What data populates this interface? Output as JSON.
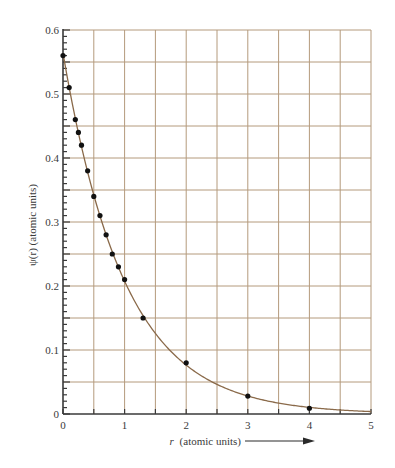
{
  "chart_data": {
    "type": "scatter",
    "title": "",
    "xlabel": "r (atomic units)",
    "xlabel_italic_part": "r",
    "xlabel_rest": "(atomic units)",
    "ylabel": "ψ(r) (atomic units)",
    "xlim": [
      0,
      5
    ],
    "ylim": [
      0,
      0.6
    ],
    "grid": true,
    "x_ticks": [
      0,
      1,
      2,
      3,
      4,
      5
    ],
    "x_tick_labels": [
      "0",
      "1",
      "2",
      "3",
      "4",
      "5"
    ],
    "y_ticks": [
      0,
      0.1,
      0.2,
      0.3,
      0.4,
      0.5,
      0.6
    ],
    "y_tick_labels": [
      "0",
      "0.1",
      "0.2",
      "0.3",
      "0.4",
      "0.5",
      "0.6"
    ],
    "x_grid_step": 0.5,
    "y_grid_step": 0.05,
    "y_minor_step": 0.01,
    "series": [
      {
        "name": "data points",
        "kind": "scatter",
        "color": "#111111",
        "x": [
          0,
          0.1,
          0.2,
          0.25,
          0.3,
          0.4,
          0.5,
          0.6,
          0.7,
          0.8,
          0.9,
          1.0,
          1.3,
          2.0,
          3.0,
          4.0
        ],
        "y": [
          0.56,
          0.51,
          0.46,
          0.44,
          0.42,
          0.38,
          0.34,
          0.31,
          0.28,
          0.25,
          0.23,
          0.21,
          0.15,
          0.08,
          0.028,
          0.009
        ]
      },
      {
        "name": "fitted curve",
        "kind": "line",
        "color": "#8a6a4a",
        "formula": "0.564 * exp(-r)",
        "amplitude": 0.564,
        "decay": 1.0
      }
    ],
    "annotations": [
      "arrow pointing right after x-axis label"
    ],
    "colors": {
      "grid": "#b49a7c",
      "axis": "#3a3a3a",
      "curve": "#8a6a4a",
      "points": "#111111"
    }
  }
}
